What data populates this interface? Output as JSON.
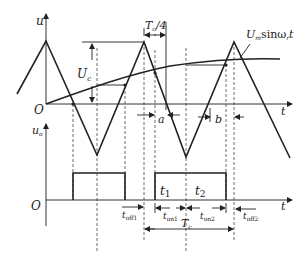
{
  "diagram": {
    "title": "",
    "upper_plot": {
      "y_axis_label": "u",
      "x_axis_label": "t",
      "origin_label": "O",
      "amplitude_label": "U",
      "amplitude_sub": "c",
      "sine_label_main": "U",
      "sine_label_sub": "m",
      "sine_label_rest": "sinω",
      "sine_label_sub2": "r",
      "sine_label_t": "t",
      "quarter_period_label": "T",
      "quarter_period_sub": "c",
      "quarter_period_rest": "/4",
      "gap_a_label": "a",
      "gap_b_label": "b"
    },
    "lower_plot": {
      "y_axis_label": "u",
      "y_axis_sub": "o",
      "x_axis_label": "t",
      "origin_label": "O",
      "t1_label": "t",
      "t1_sub": "1",
      "t2_label": "t",
      "t2_sub": "2",
      "toff1_label": "t",
      "toff1_sub": "off1",
      "ton1_label": "t",
      "ton1_sub": "on1",
      "ton2_label": "t",
      "ton2_sub": "on2",
      "toff2_label": "t",
      "toff2_sub": "off2",
      "period_label": "T",
      "period_sub": "c"
    }
  }
}
